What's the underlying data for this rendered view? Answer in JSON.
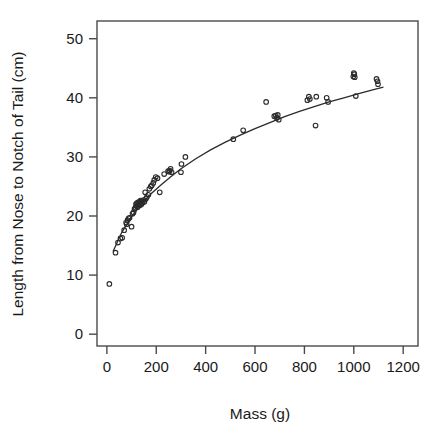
{
  "chart_data": {
    "type": "scatter",
    "title": "",
    "xlabel": "Mass (g)",
    "ylabel": "Length from Nose to Notch of Tail (cm)",
    "xlim": [
      -40,
      1260
    ],
    "ylim": [
      -2,
      53
    ],
    "xticks": [
      0,
      200,
      400,
      600,
      800,
      1000,
      1200
    ],
    "yticks": [
      0,
      10,
      20,
      30,
      40,
      50
    ],
    "xtick_labels": [
      "0",
      "200",
      "400",
      "600",
      "800",
      "1000",
      "1200"
    ],
    "ytick_labels": [
      "0",
      "10",
      "20",
      "30",
      "40",
      "50"
    ],
    "grid": false,
    "legend": "none",
    "marker": "open-circle",
    "marker_color": "#2b2b2b",
    "curve_color": "#2b2b2b",
    "frame_color": "#4a4a4a",
    "series": [
      {
        "name": "observations",
        "points": [
          [
            10,
            8.5
          ],
          [
            35,
            13.8
          ],
          [
            45,
            15.5
          ],
          [
            55,
            16.2
          ],
          [
            62,
            16.3
          ],
          [
            70,
            17.6
          ],
          [
            78,
            18.9
          ],
          [
            80,
            18.6
          ],
          [
            84,
            19.3
          ],
          [
            88,
            19.6
          ],
          [
            92,
            19.7
          ],
          [
            100,
            18.2
          ],
          [
            104,
            20.4
          ],
          [
            108,
            20.6
          ],
          [
            112,
            21.2
          ],
          [
            116,
            21.4
          ],
          [
            118,
            22.0
          ],
          [
            120,
            21.7
          ],
          [
            122,
            22.2
          ],
          [
            124,
            21.5
          ],
          [
            126,
            22.3
          ],
          [
            128,
            21.9
          ],
          [
            130,
            22.1
          ],
          [
            132,
            22.4
          ],
          [
            134,
            21.8
          ],
          [
            136,
            22.6
          ],
          [
            138,
            22.2
          ],
          [
            140,
            22.0
          ],
          [
            142,
            22.5
          ],
          [
            145,
            22.3
          ],
          [
            148,
            22.7
          ],
          [
            152,
            22.4
          ],
          [
            155,
            24.0
          ],
          [
            158,
            22.9
          ],
          [
            162,
            23.2
          ],
          [
            168,
            23.6
          ],
          [
            172,
            24.6
          ],
          [
            178,
            25.0
          ],
          [
            182,
            25.2
          ],
          [
            188,
            25.6
          ],
          [
            192,
            26.1
          ],
          [
            198,
            26.6
          ],
          [
            205,
            26.4
          ],
          [
            214,
            24.0
          ],
          [
            232,
            27.1
          ],
          [
            248,
            27.6
          ],
          [
            252,
            27.5
          ],
          [
            255,
            27.7
          ],
          [
            258,
            28.0
          ],
          [
            262,
            27.4
          ],
          [
            300,
            27.4
          ],
          [
            302,
            28.8
          ],
          [
            318,
            30.0
          ],
          [
            512,
            33.0
          ],
          [
            552,
            34.5
          ],
          [
            645,
            39.3
          ],
          [
            678,
            36.9
          ],
          [
            684,
            37.0
          ],
          [
            688,
            36.6
          ],
          [
            692,
            37.1
          ],
          [
            696,
            36.3
          ],
          [
            812,
            39.6
          ],
          [
            818,
            40.2
          ],
          [
            822,
            39.8
          ],
          [
            845,
            35.3
          ],
          [
            848,
            40.2
          ],
          [
            890,
            40.0
          ],
          [
            896,
            39.3
          ],
          [
            998,
            43.6
          ],
          [
            1000,
            44.2
          ],
          [
            1002,
            44.0
          ],
          [
            1004,
            43.5
          ],
          [
            1008,
            40.3
          ],
          [
            1092,
            43.2
          ],
          [
            1096,
            42.8
          ],
          [
            1098,
            42.3
          ]
        ]
      }
    ],
    "fit_curve": {
      "name": "fitted curve",
      "points": [
        [
          25,
          14.0
        ],
        [
          60,
          17.2
        ],
        [
          100,
          19.9
        ],
        [
          140,
          22.0
        ],
        [
          180,
          23.8
        ],
        [
          220,
          25.3
        ],
        [
          260,
          26.7
        ],
        [
          300,
          28.0
        ],
        [
          360,
          29.7
        ],
        [
          420,
          31.2
        ],
        [
          480,
          32.5
        ],
        [
          540,
          33.7
        ],
        [
          600,
          34.8
        ],
        [
          660,
          35.8
        ],
        [
          720,
          36.8
        ],
        [
          780,
          37.7
        ],
        [
          840,
          38.5
        ],
        [
          900,
          39.3
        ],
        [
          960,
          40.0
        ],
        [
          1020,
          40.7
        ],
        [
          1080,
          41.4
        ],
        [
          1120,
          41.8
        ]
      ]
    }
  }
}
